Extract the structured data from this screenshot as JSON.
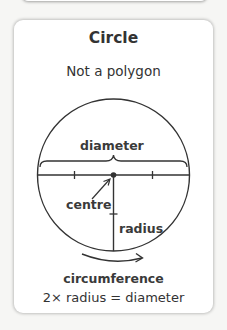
{
  "card": {
    "title": "Circle",
    "subtitle": "Not a polygon"
  },
  "diagram": {
    "shape": "circle",
    "labels": {
      "diameter": "diameter",
      "centre": "centre",
      "radius": "radius",
      "circumference": "circumference"
    },
    "formula": "2× radius = diameter",
    "colors": {
      "stroke": "#333333",
      "text": "#3a3a3a",
      "background": "#ffffff"
    }
  }
}
